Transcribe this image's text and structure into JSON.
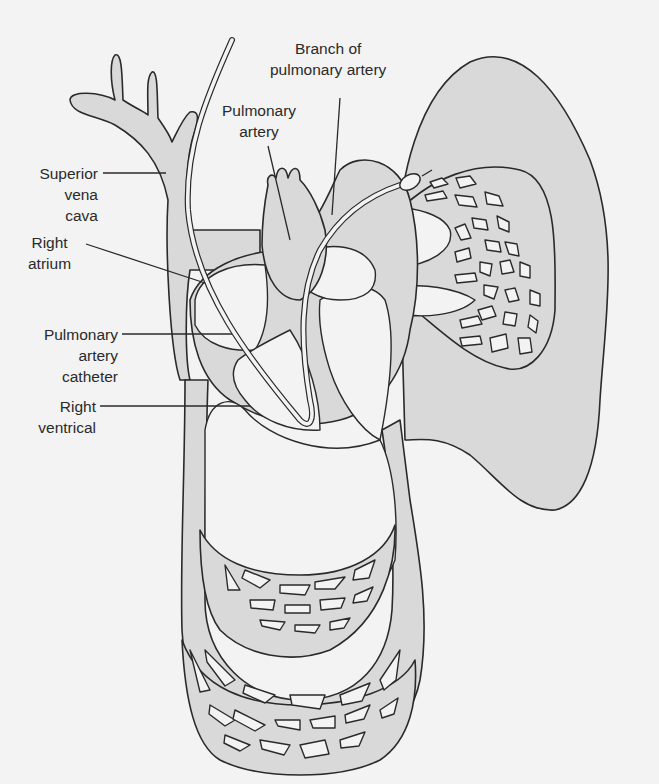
{
  "figure": {
    "colors": {
      "background": "#f3f3f3",
      "tissue_fill": "#d9d9d9",
      "outline": "#2a2a2a"
    },
    "labels": {
      "branch_of_pulmonary_artery": "Branch of\npulmonary artery",
      "pulmonary_artery": "Pulmonary\nartery",
      "superior_vena_cava": "Superior\nvena\ncava",
      "right_atrium": "Right\natrium",
      "pulmonary_artery_catheter": "Pulmonary\nartery\ncatheter",
      "right_ventrical": "Right\nventrical"
    }
  }
}
